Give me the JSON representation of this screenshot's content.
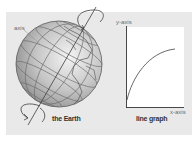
{
  "diagram": {
    "left_figure": {
      "caption": "the Earth",
      "axis_label": "axis"
    },
    "right_figure": {
      "caption": "line graph",
      "y_axis_label": "y-axis",
      "x_axis_label": "x-axis"
    }
  },
  "colors": {
    "background": "#ffffff",
    "panel": "#e9e9e9",
    "globe_light": "#f2f2f2",
    "globe_dark": "#8c8c8c",
    "line": "#4a4a4a",
    "graph_box": "#ffffff"
  }
}
